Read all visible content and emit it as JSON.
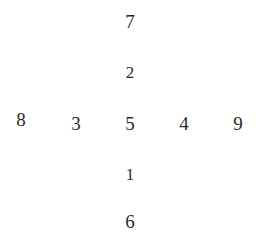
{
  "diagram": {
    "layout": "cross",
    "center": "5",
    "vertical_column": [
      "7",
      "2",
      "5",
      "1",
      "6"
    ],
    "horizontal_row": [
      "8",
      "3",
      "5",
      "4",
      "9"
    ],
    "cells": {
      "top_outer": "7",
      "top_inner": "2",
      "left_outer": "8",
      "left_inner": "3",
      "center": "5",
      "right_inner": "4",
      "right_outer": "9",
      "bottom_inner": "1",
      "bottom_outer": "6"
    },
    "text_color": "#2a2a2a",
    "background_color": "#ffffff"
  }
}
